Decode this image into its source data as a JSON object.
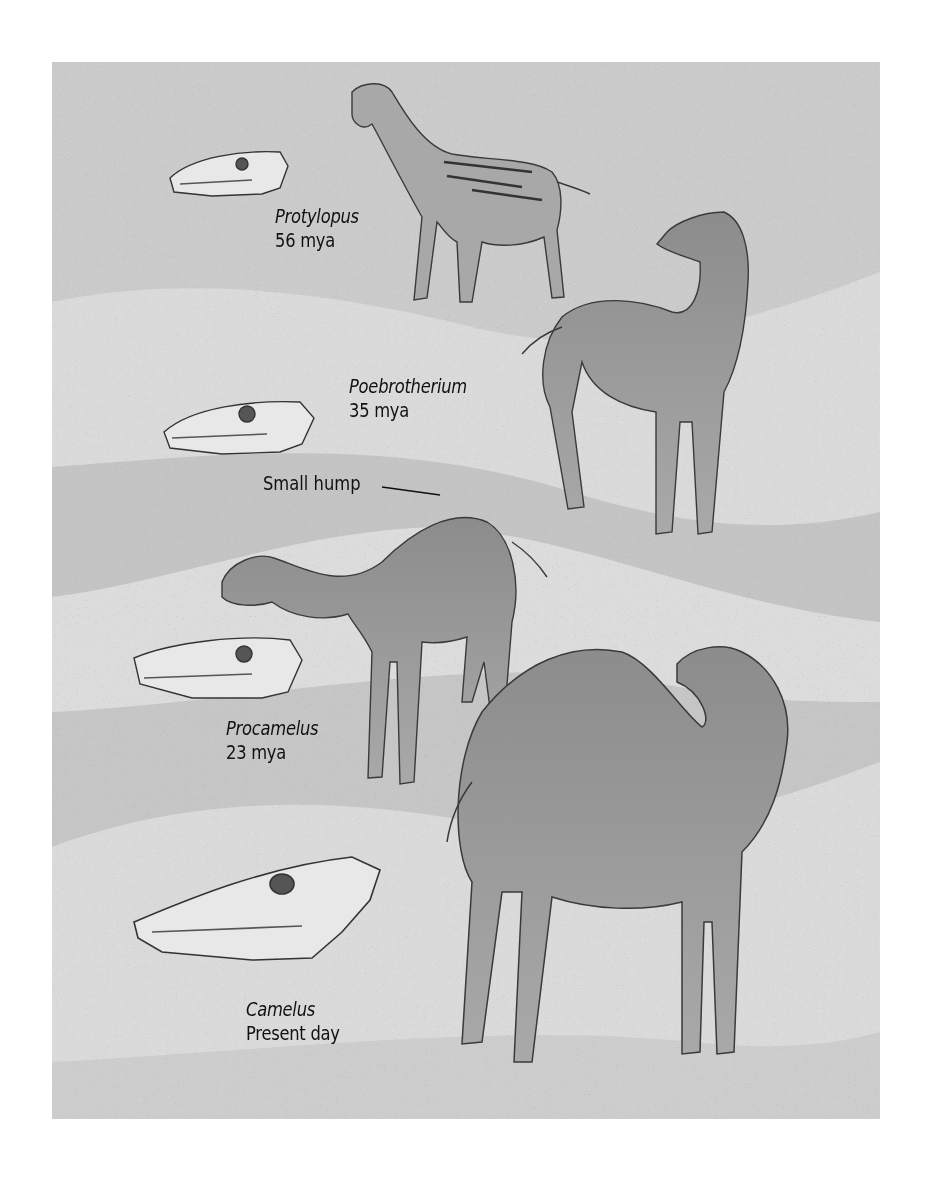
{
  "figure": {
    "background_colors": {
      "band_dark": "#c6c6c6",
      "band_light": "#dcdcdc",
      "animal_fill": "#8a8a8a",
      "animal_stroke": "#3a3a3a",
      "skull_fill": "#e6e6e6"
    },
    "stages": [
      {
        "genus": "Protylopus",
        "age": "56 mya"
      },
      {
        "genus": "Poebrotherium",
        "age": "35 mya"
      },
      {
        "genus": "Procamelus",
        "age": "23 mya"
      },
      {
        "genus": "Camelus",
        "age": "Present day"
      }
    ],
    "callouts": [
      {
        "text": "Small hump"
      }
    ]
  }
}
